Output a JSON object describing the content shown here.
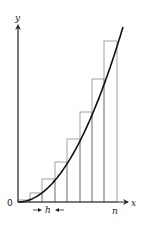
{
  "diagram": {
    "labels": {
      "y_axis": "y",
      "x_axis": "x",
      "origin": "0",
      "width": "h",
      "end": "n"
    },
    "colors": {
      "axis": "#222222",
      "curve": "#111111",
      "bars": "#8a8a8a",
      "background": "#ffffff"
    },
    "geometry": {
      "origin": [
        18,
        202
      ],
      "x_axis_end": 128,
      "y_axis_top": 25,
      "bar_edges": [
        18,
        30,
        42,
        55,
        67,
        80,
        92,
        104,
        117
      ],
      "bar_tops": [
        200,
        193,
        179,
        162,
        139,
        112,
        79,
        41
      ],
      "curve_end": [
        123,
        27
      ]
    }
  }
}
